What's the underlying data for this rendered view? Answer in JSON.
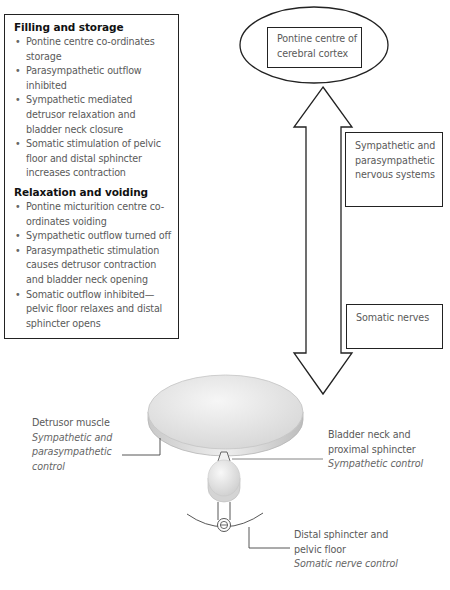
{
  "figure": {
    "colors": {
      "outline": "#222222",
      "text": "#5a5a5a",
      "heading": "#111111",
      "bladder_fill": "#e6e6e6",
      "bladder_edge": "#b8b8b8"
    }
  },
  "info_box": {
    "sections": [
      {
        "title": "Filling and storage",
        "bullets": [
          "Pontine centre co-ordinates storage",
          "Parasympathetic outflow inhibited",
          "Sympathetic mediated detrusor relaxation and bladder neck closure",
          "Somatic stimulation of pelvic floor and distal sphincter increases contraction"
        ]
      },
      {
        "title": "Relaxation and voiding",
        "bullets": [
          "Pontine micturition centre co-ordinates voiding",
          "Sympathetic outflow turned off",
          "Parasympathetic stimulation causes detrusor contraction and bladder neck opening",
          "Somatic outflow inhibited—pelvic floor relaxes and distal sphincter opens"
        ]
      }
    ]
  },
  "nodes": {
    "pontine": {
      "label": "Pontine centre of cerebral cortex",
      "shape": "ellipse-with-box"
    },
    "sympathetic": {
      "label": "Sympathetic and parasympathetic nervous systems"
    },
    "somatic": {
      "label": "Somatic nerves"
    }
  },
  "connector": {
    "type": "double-headed-arrow",
    "from": "pontine",
    "to": "bladder"
  },
  "callouts": {
    "detrusor": {
      "name": "Detrusor muscle",
      "control": "Sympathetic and parasympathetic control"
    },
    "bladder_neck": {
      "name": "Bladder neck and proximal sphincter",
      "control": "Sympathetic control"
    },
    "distal": {
      "name": "Distal sphincter and pelvic floor",
      "control": "Somatic nerve control"
    }
  }
}
